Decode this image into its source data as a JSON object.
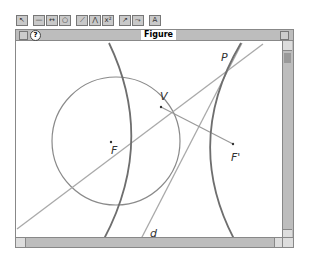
{
  "toolbar": {
    "buttons": [
      {
        "name": "pointer-tool",
        "glyph": "↖"
      },
      {
        "name": "segment-tool",
        "glyph": "—"
      },
      {
        "name": "line-tool",
        "glyph": "↔"
      },
      {
        "name": "circle-tool",
        "glyph": "○"
      },
      {
        "name": "construct-tool",
        "glyph": "⟋"
      },
      {
        "name": "transform-tool",
        "glyph": "⋀"
      },
      {
        "name": "measure-tool",
        "glyph": "x²"
      },
      {
        "name": "locus-tool",
        "glyph": "↗"
      },
      {
        "name": "display-tool",
        "glyph": "⤳"
      },
      {
        "name": "text-tool",
        "glyph": "A"
      }
    ]
  },
  "window": {
    "title": "Figure",
    "help_glyph": "?"
  },
  "figure": {
    "labels": {
      "P": "P",
      "V": "V",
      "F": "F",
      "F_prime": "F'",
      "d": "d"
    },
    "colors": {
      "hyperbola": "#6e6e6e",
      "circle": "#8a8a8a",
      "lines": "#a9a9a9"
    }
  }
}
